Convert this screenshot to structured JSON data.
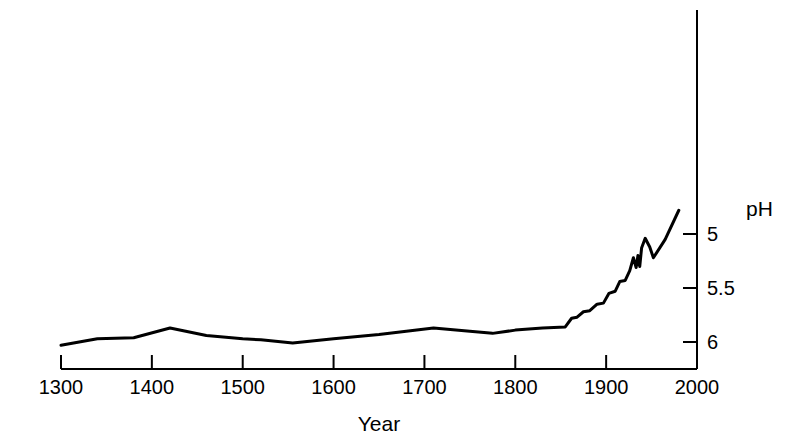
{
  "chart_data": {
    "type": "line",
    "title": "",
    "subtitle": "",
    "xlabel": "Year",
    "ylabel": "pH",
    "xlim": [
      1300,
      2000
    ],
    "ylim": [
      6.2,
      4.68
    ],
    "y_inverted": true,
    "grid": false,
    "legend": null,
    "x_ticks": [
      1300,
      1400,
      1500,
      1600,
      1700,
      1800,
      1900,
      2000
    ],
    "x_tick_labels": [
      "1300",
      "1400",
      "1500",
      "1600",
      "1700",
      "1800",
      "1900",
      "2000"
    ],
    "y_ticks": [
      5,
      5.5,
      6
    ],
    "y_tick_labels": [
      "5",
      "5.5",
      "6"
    ],
    "axis_position": {
      "x_axis": "bottom",
      "y_axis": "right"
    },
    "line_color": "#000000",
    "line_width": 3,
    "series": [
      {
        "name": "Lake water pH reconstruction",
        "x": [
          1300,
          1340,
          1380,
          1420,
          1460,
          1500,
          1520,
          1555,
          1600,
          1650,
          1710,
          1750,
          1775,
          1800,
          1830,
          1855,
          1862,
          1868,
          1875,
          1882,
          1890,
          1897,
          1903,
          1910,
          1915,
          1921,
          1926,
          1930,
          1933,
          1935,
          1937,
          1939,
          1943,
          1948,
          1952,
          1965,
          1980
        ],
        "y": [
          6.03,
          5.97,
          5.96,
          5.87,
          5.94,
          5.97,
          5.98,
          6.01,
          5.97,
          5.93,
          5.87,
          5.9,
          5.92,
          5.89,
          5.87,
          5.86,
          5.78,
          5.77,
          5.72,
          5.71,
          5.65,
          5.64,
          5.55,
          5.53,
          5.44,
          5.43,
          5.34,
          5.22,
          5.31,
          5.2,
          5.3,
          5.13,
          5.04,
          5.12,
          5.22,
          5.05,
          4.78
        ]
      }
    ]
  },
  "axis_labels": {
    "x_title": "Year",
    "y_title": "pH"
  }
}
